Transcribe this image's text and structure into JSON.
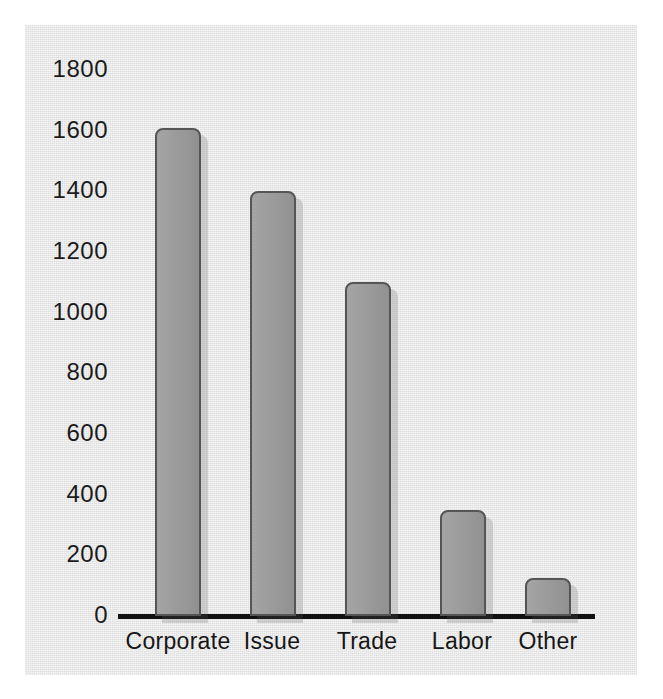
{
  "chart_data": {
    "type": "bar",
    "title": "",
    "subtitle": "",
    "xlabel": "",
    "ylabel": "",
    "categories": [
      "Corporate",
      "Issue",
      "Trade",
      "Labor",
      "Other"
    ],
    "values": [
      1610,
      1400,
      1100,
      350,
      125
    ],
    "series": [
      {
        "name": "Count",
        "values": [
          1610,
          1400,
          1100,
          350,
          125
        ]
      }
    ],
    "ylim": [
      0,
      1800
    ],
    "ytick_labels": [
      "0",
      "200",
      "400",
      "600",
      "800",
      "1000",
      "1200",
      "1400",
      "1600",
      "1800"
    ],
    "ytick_values": [
      0,
      200,
      400,
      600,
      800,
      1000,
      1200,
      1400,
      1600,
      1800
    ],
    "grid": false,
    "legend": false,
    "legend_position": "none",
    "annotations": [],
    "colors": {
      "bar_fill": "#9a9a9a",
      "bar_edge": "#555555",
      "axis_line": "#111111",
      "panel_background": "#e7e7e7",
      "page_background": "#ffffff",
      "tick_text": "#1b1b1b"
    }
  }
}
